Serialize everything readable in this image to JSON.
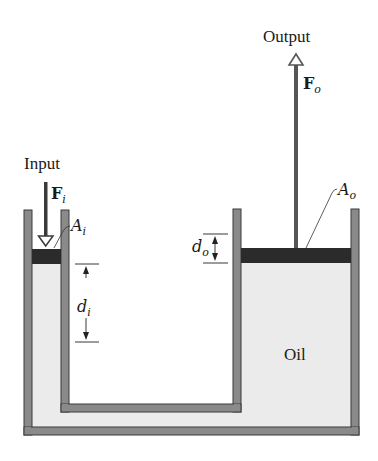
{
  "figure": {
    "labels": {
      "input": "Input",
      "output": "Output",
      "oil": "Oil",
      "input_force": {
        "main": "F",
        "sub": "i"
      },
      "output_force": {
        "main": "F",
        "sub": "o"
      },
      "input_area": {
        "main": "A",
        "sub": "i"
      },
      "output_area": {
        "main": "A",
        "sub": "o"
      },
      "input_displacement": {
        "main": "d",
        "sub": "i"
      },
      "output_displacement": {
        "main": "d",
        "sub": "o"
      }
    },
    "colors": {
      "background": "#ffffff",
      "wall": "#8a8a8a",
      "wall_outline": "#3a3a3a",
      "oil": "#ebebeb",
      "piston": "#2b2b2b",
      "rod": "#555555",
      "text": "#1a1a1a"
    }
  }
}
